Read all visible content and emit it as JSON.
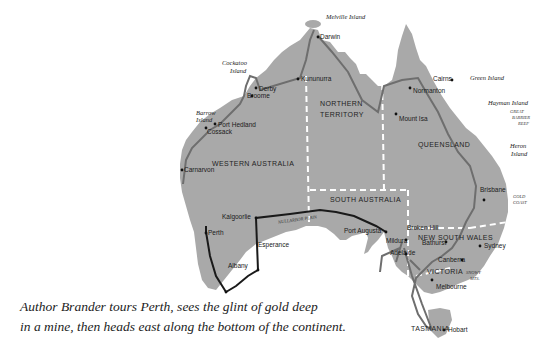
{
  "map": {
    "title": "Australia route map",
    "colors": {
      "land": "#a9a9a9",
      "route_gray": "#6e6e6e",
      "route_black": "#1a1a1a",
      "border": "#ffffff",
      "background": "#ffffff"
    },
    "regions": {
      "nt_line1": "NORTHERN",
      "nt_line2": "TERRITORY",
      "wa": "WESTERN AUSTRALIA",
      "qld": "QUEENSLAND",
      "sa": "SOUTH AUSTRALIA",
      "nsw": "NEW SOUTH WALES",
      "vic": "VICTORIA",
      "tas": "TASMANIA"
    },
    "cities": {
      "darwin": "Darwin",
      "kununurra": "Kununurra",
      "derby": "Derby",
      "broome": "Broome",
      "port_hedland": "Port Hedland",
      "cossack": "Cossack",
      "carnarvon": "Carnarvon",
      "perth": "Perth",
      "kalgoorlie": "Kalgoorlie",
      "esperance": "Esperance",
      "albany": "Albany",
      "port_augusta": "Port Augusta",
      "adelaide": "Adelaide",
      "mildura": "Mildura",
      "broken_hill": "Broken Hill",
      "melbourne": "Melbourne",
      "hobart": "Hobart",
      "canberra": "Canberra",
      "bathurst": "Bathurst",
      "sydney": "Sydney",
      "brisbane": "Brisbane",
      "cairns": "Cairns",
      "normanton": "Normanton",
      "mount_isa": "Mount Isa"
    },
    "islands": {
      "melville_island": "Melville Island",
      "cockatoo_1": "Cockatoo",
      "cockatoo_2": "Island",
      "barrow_1": "Barrow",
      "barrow_2": "Island",
      "green_island": "Green Island",
      "hayman_island": "Hayman Island",
      "heron_1": "Heron",
      "heron_2": "Island"
    },
    "features": {
      "nullarbor": "NULLARBOR PLAIN",
      "gbr_1": "GREAT",
      "gbr_2": "BARRIER",
      "gbr_3": "REEF",
      "gold_1": "GOLD",
      "gold_2": "COAST",
      "snowy_1": "SNOWY",
      "snowy_2": "MTS."
    }
  },
  "caption": {
    "line1": "Author Brander tours Perth, sees the glint of gold deep",
    "line2": "in a mine, then heads east along the bottom of the continent."
  }
}
